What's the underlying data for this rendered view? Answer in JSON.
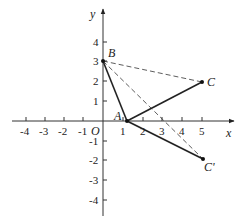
{
  "figure": {
    "type": "coordinate-plane",
    "axes": {
      "x_label": "x",
      "y_label": "y",
      "origin_label": "O",
      "x_ticks": [
        -4,
        -3,
        -2,
        -1,
        1,
        2,
        3,
        4,
        5
      ],
      "x_tick_labels": [
        "-4",
        "-3",
        "-2",
        "-1",
        "1",
        "2",
        "3",
        "4",
        "5"
      ],
      "y_ticks": [
        4,
        3,
        2,
        1,
        -1,
        -2,
        -3,
        -4
      ],
      "y_tick_labels": [
        "4",
        "3",
        "2",
        "1",
        "-1",
        "-2",
        "-3",
        "-4"
      ]
    },
    "points": [
      {
        "name": "A",
        "x": 1.2,
        "y": 0
      },
      {
        "name": "B",
        "x": 0,
        "y": 3
      },
      {
        "name": "C",
        "x": 5,
        "y": 2
      },
      {
        "name": "C'",
        "x": 5,
        "y": -2
      }
    ],
    "segments": [
      {
        "from": "B",
        "to": "A",
        "style": "solid"
      },
      {
        "from": "A",
        "to": "C",
        "style": "solid"
      },
      {
        "from": "A",
        "to": "C'",
        "style": "solid"
      },
      {
        "from": "B",
        "to": "C",
        "style": "dashed"
      },
      {
        "from": "B",
        "to": "C'",
        "style": "dashed"
      }
    ],
    "colors": {
      "line": "#222222",
      "axis": "#333333",
      "background": "#ffffff"
    }
  }
}
